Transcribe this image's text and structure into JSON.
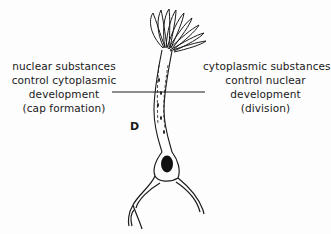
{
  "diagram": {
    "panel_letter": "D",
    "left_annotation": {
      "lines": [
        "nuclear substances",
        "control cytoplasmic",
        "development",
        "(cap formation)"
      ]
    },
    "right_annotation": {
      "lines": [
        "cytoplasmic substances",
        "control nuclear",
        "development",
        "(division)"
      ]
    },
    "structures": [
      "cap",
      "stalk",
      "nucleus",
      "rhizoid"
    ],
    "colors": {
      "ink": "#1a1a1a",
      "background": "#fdfdfd"
    }
  }
}
